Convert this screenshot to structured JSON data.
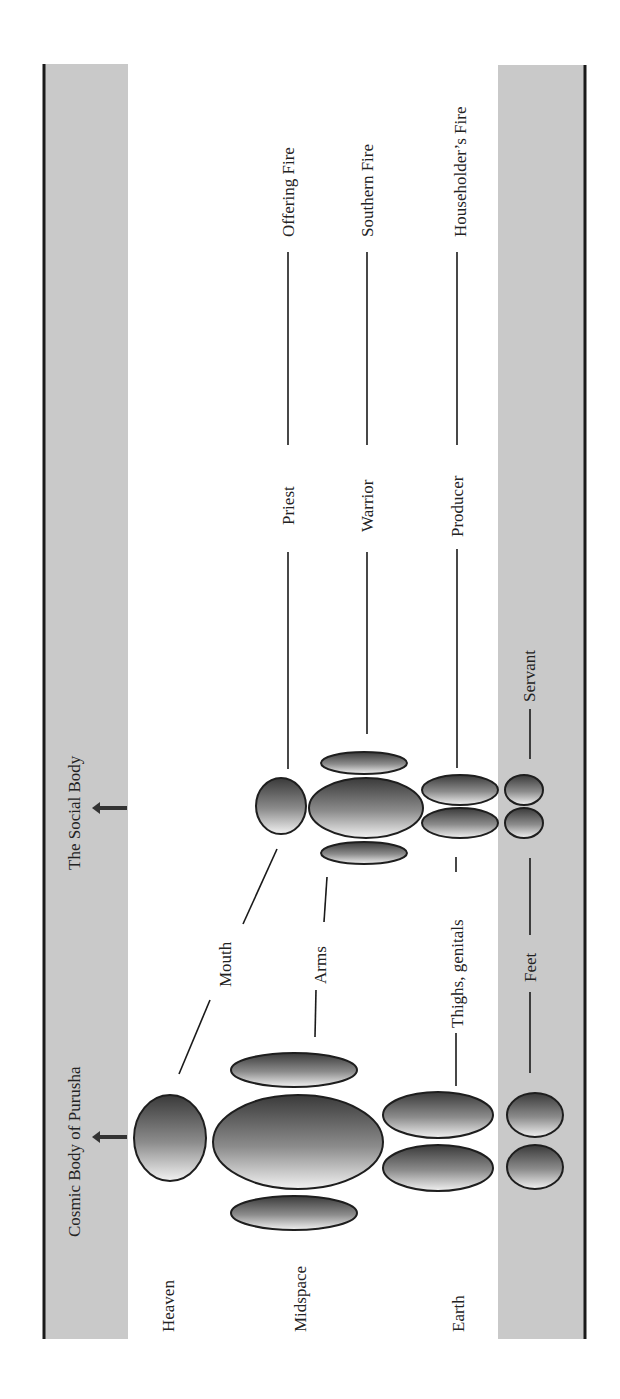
{
  "colors": {
    "band": "#c9c9c9",
    "ink": "#1a1a1a",
    "gradient_dark": "#3a3a3a",
    "gradient_light": "#f0f0f0"
  },
  "bands": {
    "left_title": "Cosmic Body of Purusha",
    "left_title_2": "The Social Body"
  },
  "cosmic_levels": {
    "heaven": "Heaven",
    "midspace": "Midspace",
    "earth": "Earth"
  },
  "body_parts": {
    "mouth": "Mouth",
    "arms": "Arms",
    "thighs": "Thighs, genitals",
    "feet": "Feet"
  },
  "social_classes": {
    "priest": "Priest",
    "warrior": "Warrior",
    "producer": "Producer",
    "servant": "Servant"
  },
  "fires": {
    "offering": "Offering Fire",
    "southern": "Southern Fire",
    "householder": "Householder’s Fire"
  },
  "icons": {
    "arrow": "arrow-up-icon"
  }
}
